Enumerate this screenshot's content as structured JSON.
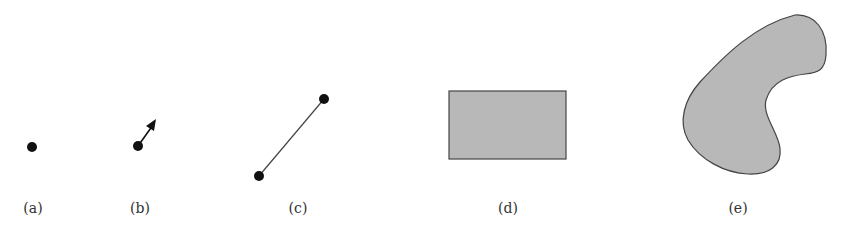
{
  "figures": [
    {
      "id": "a",
      "label": "(a)",
      "kind": "point",
      "description": "single point"
    },
    {
      "id": "b",
      "label": "(b)",
      "kind": "point-with-vector",
      "description": "point with direction arrow"
    },
    {
      "id": "c",
      "label": "(c)",
      "kind": "line-segment",
      "description": "line segment between two points"
    },
    {
      "id": "d",
      "label": "(d)",
      "kind": "rectangle",
      "description": "filled rectangle"
    },
    {
      "id": "e",
      "label": "(e)",
      "kind": "free-form-region",
      "description": "filled irregular region"
    }
  ],
  "colors": {
    "point": "#111111",
    "stroke": "#333333",
    "fill": "#b8b8b8",
    "label": "#333333"
  }
}
